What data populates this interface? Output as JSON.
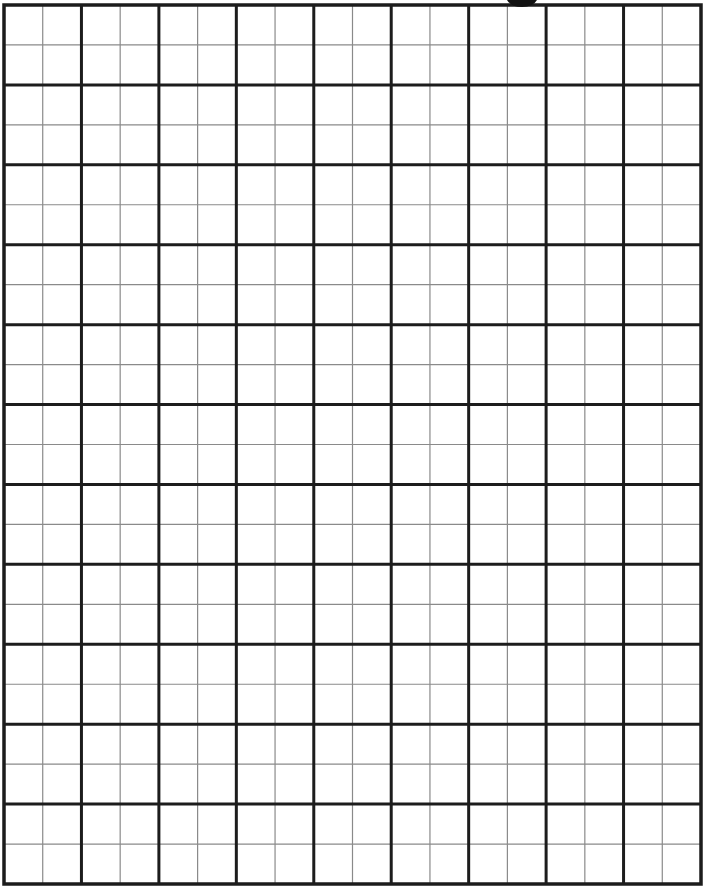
{
  "page": {
    "type": "graph-paper"
  },
  "grid": {
    "major_columns": 9,
    "major_rows": 11,
    "minor_subdivisions_per_major": 2,
    "colors": {
      "background": "#ffffff",
      "major_line": "#1c1c1c",
      "minor_line": "#8a8a8a",
      "top_marker": "#111111"
    }
  },
  "top_marker": {
    "shape": "semicircle",
    "present": true
  }
}
